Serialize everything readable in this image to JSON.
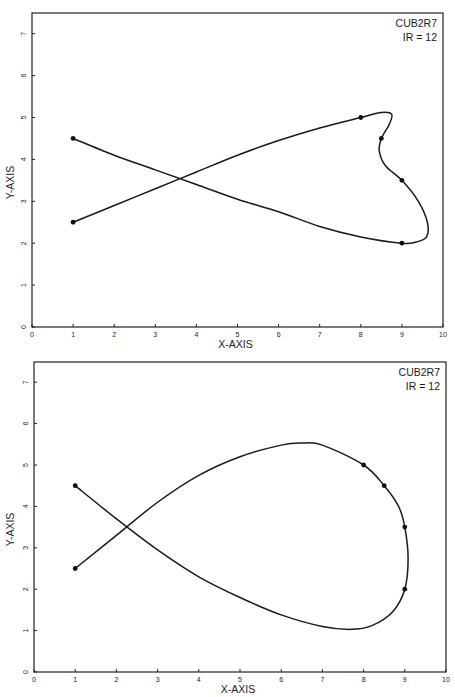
{
  "chart_data": [
    {
      "type": "line",
      "title": "",
      "annotation": [
        "CUB2R7",
        "IR = 12"
      ],
      "xlabel": "X-AXIS",
      "ylabel": "Y-AXIS",
      "xlim": [
        0,
        10
      ],
      "ylim": [
        0,
        7.5
      ],
      "xticks": [
        0,
        1,
        2,
        3,
        4,
        5,
        6,
        7,
        8,
        9,
        10
      ],
      "yticks": [
        0,
        1,
        2,
        3,
        4,
        5,
        6,
        7
      ],
      "grid": false,
      "legend": null,
      "control_points": [
        {
          "x": 1,
          "y": 2.5
        },
        {
          "x": 8,
          "y": 5.0
        },
        {
          "x": 8.5,
          "y": 4.5
        },
        {
          "x": 9,
          "y": 3.5
        },
        {
          "x": 9,
          "y": 2.0
        },
        {
          "x": 1,
          "y": 4.5
        }
      ],
      "curve": [
        [
          1,
          2.5
        ],
        [
          2,
          2.9
        ],
        [
          3,
          3.3
        ],
        [
          4,
          3.7
        ],
        [
          5,
          4.1
        ],
        [
          6,
          4.45
        ],
        [
          7,
          4.75
        ],
        [
          8,
          5.0
        ],
        [
          8.5,
          5.12
        ],
        [
          8.75,
          5.08
        ],
        [
          8.7,
          4.85
        ],
        [
          8.5,
          4.5
        ],
        [
          8.45,
          4.2
        ],
        [
          8.6,
          3.85
        ],
        [
          9,
          3.5
        ],
        [
          9.4,
          3.0
        ],
        [
          9.62,
          2.5
        ],
        [
          9.6,
          2.15
        ],
        [
          9.35,
          2.03
        ],
        [
          9,
          2.0
        ],
        [
          8,
          2.15
        ],
        [
          7,
          2.4
        ],
        [
          6,
          2.75
        ],
        [
          5,
          3.05
        ],
        [
          4,
          3.4
        ],
        [
          3,
          3.75
        ],
        [
          2,
          4.1
        ],
        [
          1,
          4.5
        ]
      ],
      "curve_style": "tight"
    },
    {
      "type": "line",
      "title": "",
      "annotation": [
        "CUB2R7",
        "IR = 12"
      ],
      "xlabel": "X-AXIS",
      "ylabel": "Y-AXIS",
      "xlim": [
        0,
        10
      ],
      "ylim": [
        0,
        7.5
      ],
      "xticks": [
        0,
        1,
        2,
        3,
        4,
        5,
        6,
        7,
        8,
        9,
        10
      ],
      "yticks": [
        0,
        1,
        2,
        3,
        4,
        5,
        6,
        7
      ],
      "grid": false,
      "legend": null,
      "control_points": [
        {
          "x": 1,
          "y": 2.5
        },
        {
          "x": 8,
          "y": 5.0
        },
        {
          "x": 8.5,
          "y": 4.5
        },
        {
          "x": 9,
          "y": 3.5
        },
        {
          "x": 9,
          "y": 2.0
        },
        {
          "x": 1,
          "y": 4.5
        }
      ],
      "curve": [
        [
          1,
          2.5
        ],
        [
          2,
          3.3
        ],
        [
          3,
          4.1
        ],
        [
          4,
          4.75
        ],
        [
          5,
          5.2
        ],
        [
          6,
          5.48
        ],
        [
          6.5,
          5.53
        ],
        [
          7,
          5.48
        ],
        [
          8,
          5.0
        ],
        [
          8.5,
          4.5
        ],
        [
          8.85,
          4.0
        ],
        [
          9,
          3.5
        ],
        [
          9.08,
          2.75
        ],
        [
          9,
          2.0
        ],
        [
          8.7,
          1.45
        ],
        [
          8.2,
          1.12
        ],
        [
          7.7,
          1.03
        ],
        [
          7,
          1.1
        ],
        [
          6,
          1.38
        ],
        [
          5,
          1.8
        ],
        [
          4,
          2.3
        ],
        [
          3,
          2.95
        ],
        [
          2,
          3.7
        ],
        [
          1,
          4.5
        ]
      ],
      "curve_style": "smooth"
    }
  ],
  "plots": [
    {
      "annotation_line1": "CUB2R7",
      "annotation_line2": "IR = 12",
      "xlabel": "X-AXIS",
      "ylabel": "Y-AXIS",
      "frame": {
        "left": 32,
        "right": 443,
        "top": 13,
        "bottom": 327,
        "y_unit_px": 41.9
      }
    },
    {
      "annotation_line1": "CUB2R7",
      "annotation_line2": "IR = 12",
      "xlabel": "X-AXIS",
      "ylabel": "Y-AXIS",
      "frame": {
        "left": 34,
        "right": 446,
        "top": 362,
        "bottom": 672,
        "y_unit_px": 41.4
      }
    }
  ],
  "colors": {
    "line": "#1a1a1a",
    "frame": "#222222",
    "background": "#ffffff"
  }
}
